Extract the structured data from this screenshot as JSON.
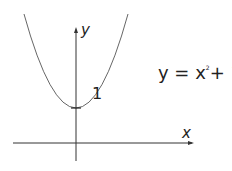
{
  "diagram": {
    "equation": {
      "lhs": "y = x",
      "exponent": "2",
      "rhs": "+ 1"
    },
    "axis_labels": {
      "x": "x",
      "y": "y"
    },
    "intercept_label": "1",
    "colors": {
      "axis": "#333333",
      "curve": "#555555",
      "text": "#222222"
    }
  }
}
